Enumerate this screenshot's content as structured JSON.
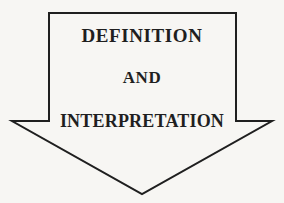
{
  "figure": {
    "kind": "block-arrow-diagram",
    "direction": "down",
    "background_color": "#f7f6f3",
    "stroke_color": "#1f1f1f",
    "stroke_width": 2,
    "fill": "none",
    "width": 284,
    "height": 203,
    "outline_points": "49,13 236,13 236,121 272,121 142,194 12,121 49,121 49,13"
  },
  "labels": {
    "line1": "DEFINITION",
    "line2": "AND",
    "line3": "INTERPRETATION"
  },
  "text_color": "#1f1f1f"
}
